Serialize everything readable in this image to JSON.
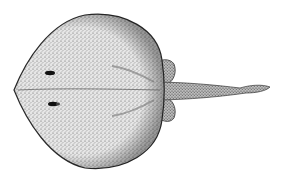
{
  "image": {
    "subject": "stingray illustration",
    "style": "stippled black-and-white drawing",
    "view": "dorsal",
    "colors": {
      "background": "#ffffff",
      "ink": "#2a2a2a",
      "fill": "#d8d8d8"
    }
  }
}
